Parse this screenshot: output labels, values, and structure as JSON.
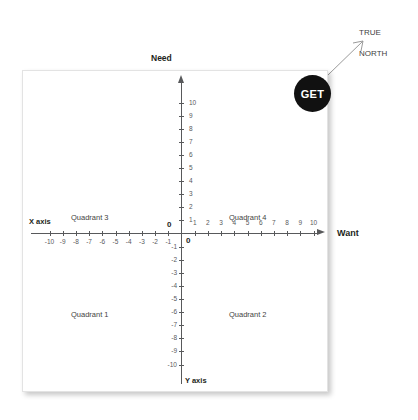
{
  "diagram": {
    "top_label": "Need",
    "right_label": "Want",
    "x_axis_name": "X axis",
    "y_axis_name": "Y axis",
    "origin_label_top": "0",
    "origin_label_bottom": "0",
    "badge_label": "GET",
    "annotation": "TRUE\nNORTH",
    "annotation_line1": "TRUE",
    "annotation_line2": "NORTH",
    "quadrants": [
      {
        "id": "q3",
        "label": "Quadrant 3"
      },
      {
        "id": "q4",
        "label": "Quadrant 4"
      },
      {
        "id": "q1",
        "label": "Quadrant 1"
      },
      {
        "id": "q2",
        "label": "Quadrant 2"
      }
    ],
    "colors": {
      "badge_background": "#111111",
      "badge_text": "#ffffff",
      "axis": "#58595b",
      "text": "#231f20",
      "card_background": "#ffffff"
    }
  },
  "chart_data": {
    "type": "scatter",
    "title": "",
    "xlabel": "X axis",
    "ylabel": "Y axis",
    "x_axis_alias": "Want",
    "y_axis_alias": "Need",
    "xlim": [
      -10,
      10
    ],
    "ylim": [
      -10,
      10
    ],
    "grid": false,
    "x_ticks": [
      -10,
      -9,
      -8,
      -7,
      -6,
      -5,
      -4,
      -3,
      -2,
      -1,
      0,
      1,
      2,
      3,
      4,
      5,
      6,
      7,
      8,
      9,
      10
    ],
    "y_ticks": [
      -10,
      -9,
      -8,
      -7,
      -6,
      -5,
      -4,
      -3,
      -2,
      -1,
      0,
      1,
      2,
      3,
      4,
      5,
      6,
      7,
      8,
      9,
      10
    ],
    "x_tick_labels": [
      "-10",
      "-9",
      "-8",
      "-7",
      "-6",
      "-5",
      "-4",
      "-3",
      "-2",
      "-1",
      "0",
      "1",
      "2",
      "3",
      "4",
      "5",
      "6",
      "7",
      "8",
      "9",
      "10"
    ],
    "y_tick_labels": [
      "-10",
      "-9",
      "-8",
      "-7",
      "-6",
      "-5",
      "-4",
      "-3",
      "-2",
      "-1",
      "0",
      "1",
      "2",
      "3",
      "4",
      "5",
      "6",
      "7",
      "8",
      "9",
      "10"
    ],
    "quadrant_annotations": [
      {
        "label": "Quadrant 3",
        "x": -5.5,
        "y": 6.5
      },
      {
        "label": "Quadrant 4",
        "x": 4.5,
        "y": 6.5
      },
      {
        "label": "Quadrant 1",
        "x": -5.5,
        "y": -6.0
      },
      {
        "label": "Quadrant 2",
        "x": 4.5,
        "y": -6.0
      }
    ],
    "markers": [
      {
        "label": "GET",
        "x": 9.2,
        "y": 10.9,
        "shape": "circle",
        "color": "#111111"
      }
    ],
    "annotations": [
      {
        "text": "TRUE NORTH",
        "target": "upper-right-corner",
        "arrow": true
      }
    ],
    "legend": null
  }
}
